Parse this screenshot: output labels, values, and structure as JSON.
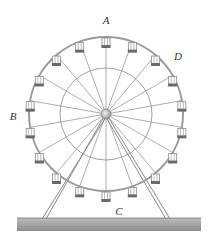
{
  "figure": {
    "labels": [
      {
        "id": "A",
        "text": "A",
        "x": 106,
        "y": 20
      },
      {
        "id": "B",
        "text": "B",
        "x": 13,
        "y": 116
      },
      {
        "id": "C",
        "text": "C",
        "x": 119,
        "y": 211
      },
      {
        "id": "D",
        "text": "D",
        "x": 178,
        "y": 56
      }
    ]
  },
  "wheel": {
    "center_x": 106,
    "center_y": 114,
    "rim_radius": 77,
    "inner_radius": 46,
    "hub_radius": 5,
    "spoke_count": 18,
    "gondola_count": 18
  },
  "support": {
    "left_foot_x": 44,
    "right_foot_x": 168,
    "foot_y": 219
  },
  "ground": {
    "x": 17,
    "y": 218,
    "width": 184,
    "height": 13
  },
  "colors": {
    "line": "#8a8a8a",
    "rim": "#9a9a9a",
    "gondola_body": "#ffffff",
    "gondola_base": "#6a6a6a",
    "ground_top": "#bdbdbd",
    "ground_bottom": "#8c8c8c",
    "label": "#333333"
  }
}
